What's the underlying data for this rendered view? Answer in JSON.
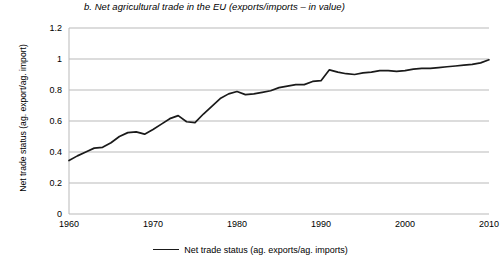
{
  "chart_data": {
    "type": "line",
    "title": "b. Net agricultural trade in the EU (exports/imports – in value)",
    "xlabel": "",
    "ylabel": "Net trade status (ag. export/ag. import)",
    "xlim": [
      1960,
      2010
    ],
    "ylim": [
      0,
      1.2
    ],
    "xticks": [
      1960,
      1970,
      1980,
      1990,
      2000,
      2010
    ],
    "yticks": [
      0,
      0.2,
      0.4,
      0.6,
      0.8,
      1,
      1.2
    ],
    "ytick_labels": [
      "0",
      "0.2",
      "0.4",
      "0.6",
      "0.8",
      "1",
      "1.2"
    ],
    "xtick_labels": [
      "1960",
      "1970",
      "1980",
      "1990",
      "2000",
      "2010"
    ],
    "grid": "horizontal",
    "legend_position": "bottom",
    "line_color": "#1a1a1a",
    "grid_color": "#b9b9b9",
    "series": [
      {
        "name": "Net trade status (ag. exports/ag. imports)",
        "x": [
          1960,
          1961,
          1962,
          1963,
          1964,
          1965,
          1966,
          1967,
          1968,
          1969,
          1970,
          1971,
          1972,
          1973,
          1974,
          1975,
          1976,
          1977,
          1978,
          1979,
          1980,
          1981,
          1982,
          1983,
          1984,
          1985,
          1986,
          1987,
          1988,
          1989,
          1990,
          1991,
          1992,
          1993,
          1994,
          1995,
          1996,
          1997,
          1998,
          1999,
          2000,
          2001,
          2002,
          2003,
          2004,
          2005,
          2006,
          2007,
          2008,
          2009,
          2010
        ],
        "y": [
          0.345,
          0.375,
          0.4,
          0.425,
          0.43,
          0.46,
          0.5,
          0.525,
          0.53,
          0.515,
          0.545,
          0.58,
          0.615,
          0.635,
          0.595,
          0.59,
          0.645,
          0.695,
          0.745,
          0.775,
          0.79,
          0.77,
          0.775,
          0.785,
          0.795,
          0.815,
          0.825,
          0.835,
          0.835,
          0.855,
          0.86,
          0.93,
          0.915,
          0.905,
          0.9,
          0.91,
          0.915,
          0.925,
          0.925,
          0.92,
          0.925,
          0.935,
          0.94,
          0.94,
          0.945,
          0.95,
          0.955,
          0.96,
          0.965,
          0.975,
          0.995
        ]
      }
    ]
  },
  "legend": {
    "entry": "Net trade status (ag. exports/ag. imports)"
  }
}
